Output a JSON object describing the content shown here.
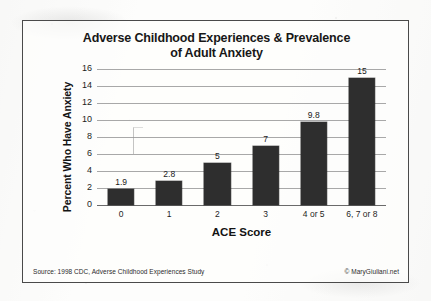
{
  "figure": {
    "border_color": "#4a4a4a",
    "background_color": "#fdfdfc",
    "bar_color": "#2e2e2e",
    "gridline_color": "#a8a8a8"
  },
  "footer": {
    "source": "Source: 1998 CDC, Adverse Childhood Experiences Study",
    "copyright": "© MaryGiuliani.net"
  },
  "chart_data": {
    "type": "bar",
    "title": "Adverse Childhood Experiences & Prevalence of Adult Anxiety",
    "title_line1": "Adverse Childhood Experiences & Prevalence",
    "title_line2": "of Adult Anxiety",
    "xlabel": "ACE Score",
    "ylabel": "Percent Who Have Anxiety",
    "categories": [
      "0",
      "1",
      "2",
      "3",
      "4 or 5",
      "6, 7 or 8"
    ],
    "values": [
      1.9,
      2.8,
      5,
      7,
      9.8,
      15
    ],
    "value_labels": [
      "1.9",
      "2.8",
      "5",
      "7",
      "9.8",
      "15"
    ],
    "ylim": [
      0,
      16
    ],
    "yticks": [
      0,
      2,
      4,
      6,
      8,
      10,
      12,
      14,
      16
    ],
    "ytick_labels": [
      "0",
      "2",
      "4",
      "6",
      "8",
      "10",
      "12",
      "14",
      "16"
    ],
    "grid": true,
    "grid_axis": "y",
    "legend": false,
    "legend_position": "none",
    "series": [
      {
        "name": "Percent Who Have Anxiety",
        "values": [
          1.9,
          2.8,
          5,
          7,
          9.8,
          15
        ]
      }
    ]
  }
}
